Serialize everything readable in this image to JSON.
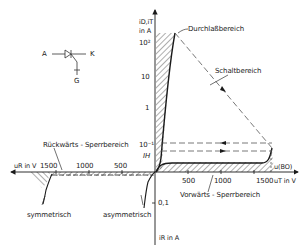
{
  "symbol": {
    "anode": "A",
    "cathode": "K",
    "gate": "G"
  },
  "y_axis": {
    "label_top_line1": "i_D, i_T",
    "label_top_line1_display": "iD,iT",
    "label_top_line2": "in A",
    "ticks_positive": [
      "10²",
      "10",
      "1",
      "10⁻¹"
    ],
    "holding_current": "IH",
    "ticks_negative": [
      "0,1"
    ],
    "label_bottom": "iR in A"
  },
  "x_axis": {
    "label_right": "uT in V",
    "label_left": "uR in V",
    "breakover_label": "u(BO)",
    "ticks_positive": [
      "500",
      "1000",
      "1500"
    ],
    "ticks_negative": [
      "1500",
      "1000",
      "500"
    ]
  },
  "regions": {
    "forward_conduction": "Durchlaßbereich",
    "switching": "Schaltbereich",
    "reverse_blocking": "Rückwärts - Sperrbereich",
    "forward_blocking": "Vorwärts - Sperrbereich",
    "symmetric": "symmetrisch",
    "asymmetric": "asymmetrisch"
  },
  "colors": {
    "line": "#1a1a1a",
    "dashed": "#444444",
    "hatch": "#333333",
    "background": "#ffffff"
  }
}
